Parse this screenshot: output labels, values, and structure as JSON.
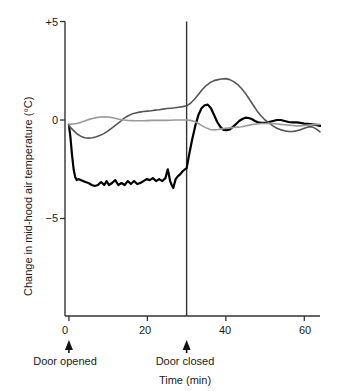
{
  "chart_data": {
    "type": "line",
    "title": "",
    "xlabel": "Time (min)",
    "ylabel": "Change in mid-hood air temperature (°C)",
    "xlim": [
      -1,
      64
    ],
    "ylim": [
      -6.6,
      5
    ],
    "xticks": [
      0,
      20,
      40,
      60
    ],
    "xticklabels": [
      "0",
      "20",
      "40",
      "60"
    ],
    "yticks": [
      5,
      0,
      -5
    ],
    "yticklabels": [
      "+5",
      "0",
      "−5"
    ],
    "grid": false,
    "legend_position": "none",
    "annotations": [
      {
        "name": "door-opened",
        "text": "Door opened",
        "x": 0,
        "marker": "up-arrow"
      },
      {
        "name": "door-closed",
        "text": "Door closed",
        "x": 30,
        "marker": "up-arrow"
      }
    ],
    "vlines": [
      {
        "x": 30,
        "label": "Door closed",
        "color": "#333333"
      }
    ],
    "series": [
      {
        "name": "trace-black",
        "color": "#000000",
        "width": 2.2,
        "x": [
          0,
          0.4,
          0.8,
          1.2,
          1.6,
          2,
          2.4,
          3,
          3.6,
          4.2,
          5,
          5.8,
          6.6,
          7.4,
          8.2,
          9,
          9.6,
          10.2,
          11,
          11.8,
          12.6,
          13.4,
          14.2,
          15,
          15.8,
          16.6,
          17.4,
          18.2,
          19,
          19.8,
          20.6,
          21.4,
          22.2,
          23,
          23.8,
          24.6,
          25.2,
          25.8,
          26.2,
          26.6,
          27.2,
          27.8,
          28.4,
          29,
          29.6,
          30,
          30.6,
          31.4,
          32.2,
          33,
          33.8,
          34.6,
          35.4,
          36.2,
          37,
          37.8,
          38.6,
          39.4,
          40.2,
          41,
          41.8,
          42.6,
          43.4,
          44.2,
          45,
          45.8,
          46.6,
          47.4,
          48.2,
          49,
          50,
          51,
          52,
          53,
          54,
          55,
          56,
          57,
          58,
          59,
          60,
          61,
          62,
          63,
          64
        ],
        "y": [
          -0.25,
          -0.9,
          -1.8,
          -2.5,
          -2.9,
          -3.05,
          -3.0,
          -3.05,
          -3.1,
          -3.15,
          -3.2,
          -3.3,
          -3.35,
          -3.3,
          -3.15,
          -3.3,
          -3.1,
          -3.3,
          -3.2,
          -3.05,
          -3.3,
          -3.2,
          -3.3,
          -3.1,
          -3.25,
          -3.1,
          -3.25,
          -3.2,
          -3.1,
          -3.0,
          -3.05,
          -2.95,
          -3.1,
          -3.0,
          -3.1,
          -2.95,
          -2.5,
          -3.1,
          -3.3,
          -3.45,
          -3.0,
          -2.85,
          -2.75,
          -2.6,
          -2.5,
          -2.45,
          -1.8,
          -1.0,
          -0.3,
          0.25,
          0.6,
          0.75,
          0.78,
          0.6,
          0.25,
          -0.1,
          -0.35,
          -0.5,
          -0.52,
          -0.48,
          -0.35,
          -0.2,
          -0.05,
          0.05,
          0.12,
          0.1,
          0.05,
          -0.05,
          -0.12,
          -0.15,
          -0.15,
          -0.1,
          -0.05,
          0.0,
          0.0,
          -0.05,
          -0.1,
          -0.12,
          -0.12,
          -0.15,
          -0.18,
          -0.2,
          -0.22,
          -0.25,
          -0.3
        ]
      },
      {
        "name": "trace-dark-gray",
        "color": "#555555",
        "width": 1.6,
        "x": [
          0,
          1,
          2,
          3,
          4,
          5,
          6,
          7,
          8,
          9,
          10,
          11,
          12,
          13,
          14,
          15,
          16,
          17,
          18,
          19,
          20,
          21,
          22,
          23,
          24,
          25,
          26,
          27,
          28,
          29,
          30,
          31,
          32,
          33,
          34,
          35,
          36,
          37,
          38,
          39,
          40,
          41,
          42,
          43,
          44,
          45,
          46,
          47,
          48,
          49,
          50,
          51,
          52,
          53,
          54,
          55,
          56,
          57,
          58,
          59,
          60,
          61,
          62,
          63,
          64
        ],
        "y": [
          -0.3,
          -0.5,
          -0.7,
          -0.82,
          -0.9,
          -0.92,
          -0.9,
          -0.85,
          -0.78,
          -0.68,
          -0.55,
          -0.4,
          -0.25,
          -0.1,
          0.08,
          0.2,
          0.3,
          0.36,
          0.4,
          0.43,
          0.45,
          0.47,
          0.5,
          0.52,
          0.55,
          0.58,
          0.6,
          0.62,
          0.65,
          0.68,
          0.72,
          0.85,
          1.05,
          1.3,
          1.55,
          1.75,
          1.9,
          2.0,
          2.05,
          2.08,
          2.1,
          2.05,
          1.95,
          1.8,
          1.6,
          1.35,
          1.05,
          0.75,
          0.45,
          0.2,
          0.0,
          -0.15,
          -0.3,
          -0.42,
          -0.5,
          -0.55,
          -0.58,
          -0.58,
          -0.55,
          -0.5,
          -0.42,
          -0.35,
          -0.35,
          -0.45,
          -0.6
        ]
      },
      {
        "name": "trace-light-gray",
        "color": "#9a9a9a",
        "width": 1.6,
        "x": [
          0,
          1,
          2,
          3,
          4,
          5,
          6,
          7,
          8,
          9,
          10,
          11,
          12,
          13,
          14,
          15,
          16,
          17,
          18,
          19,
          20,
          21,
          22,
          23,
          24,
          25,
          26,
          27,
          28,
          29,
          30,
          31,
          32,
          33,
          34,
          35,
          36,
          37,
          38,
          39,
          40,
          41,
          42,
          43,
          44,
          45,
          46,
          47,
          48,
          49,
          50,
          51,
          52,
          53,
          54,
          55,
          56,
          57,
          58,
          59,
          60,
          61,
          62,
          63,
          64
        ],
        "y": [
          -0.22,
          -0.2,
          -0.18,
          -0.12,
          -0.05,
          0.02,
          0.08,
          0.12,
          0.15,
          0.16,
          0.15,
          0.12,
          0.08,
          0.03,
          0.0,
          -0.02,
          -0.03,
          -0.04,
          -0.04,
          -0.04,
          -0.03,
          -0.02,
          -0.02,
          -0.02,
          -0.02,
          -0.02,
          -0.01,
          0.0,
          0.0,
          0.0,
          0.0,
          -0.02,
          -0.08,
          -0.18,
          -0.3,
          -0.4,
          -0.48,
          -0.5,
          -0.48,
          -0.45,
          -0.42,
          -0.4,
          -0.38,
          -0.36,
          -0.34,
          -0.3,
          -0.26,
          -0.22,
          -0.2,
          -0.18,
          -0.18,
          -0.18,
          -0.18,
          -0.2,
          -0.22,
          -0.24,
          -0.26,
          -0.28,
          -0.3,
          -0.3,
          -0.28,
          -0.26,
          -0.24,
          -0.22,
          -0.22
        ]
      }
    ]
  }
}
